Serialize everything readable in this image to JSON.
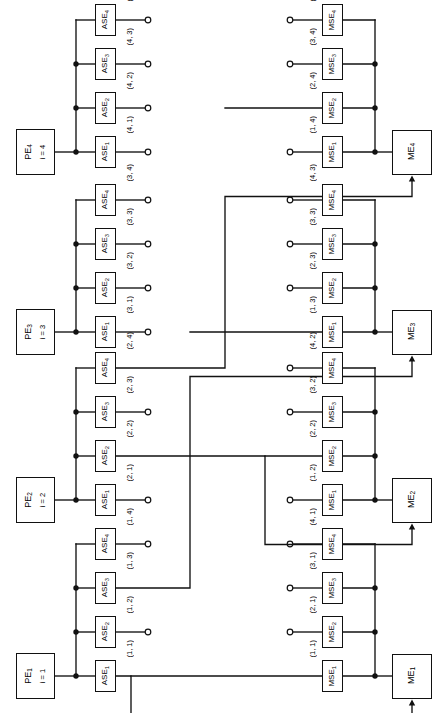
{
  "diagram": {
    "pe_label_prefix": "PE",
    "ase_label_prefix": "ASE",
    "mse_label_prefix": "MSE",
    "me_label_prefix": "ME",
    "line_color": "#111111",
    "background": "#ffffff"
  },
  "pe_groups": [
    {
      "id": "pe4",
      "name": "PE",
      "name_sub": "4",
      "index_text": "i = 4",
      "switches": [
        {
          "name": "ASE",
          "sub": "1",
          "port": "(4, 1)",
          "terminal": "open"
        },
        {
          "name": "ASE",
          "sub": "2",
          "port": "(4, 2)",
          "terminal": "open"
        },
        {
          "name": "ASE",
          "sub": "3",
          "port": "(4, 3)",
          "terminal": "open"
        },
        {
          "name": "ASE",
          "sub": "4",
          "port": "(4, 4)",
          "terminal": "open"
        }
      ]
    },
    {
      "id": "pe3",
      "name": "PE",
      "name_sub": "3",
      "index_text": "i = 3",
      "switches": [
        {
          "name": "ASE",
          "sub": "1",
          "port": "(3, 1)",
          "terminal": "open"
        },
        {
          "name": "ASE",
          "sub": "2",
          "port": "(3, 2)",
          "terminal": "open"
        },
        {
          "name": "ASE",
          "sub": "3",
          "port": "(3, 3)",
          "terminal": "open"
        },
        {
          "name": "ASE",
          "sub": "4",
          "port": "(3, 4)",
          "terminal": "open"
        }
      ]
    },
    {
      "id": "pe2",
      "name": "PE",
      "name_sub": "2",
      "index_text": "i = 2",
      "switches": [
        {
          "name": "ASE",
          "sub": "1",
          "port": "(2, 1)",
          "terminal": "open"
        },
        {
          "name": "ASE",
          "sub": "2",
          "port": "(2, 2)",
          "terminal": "routed"
        },
        {
          "name": "ASE",
          "sub": "3",
          "port": "(2, 3)",
          "terminal": "open"
        },
        {
          "name": "ASE",
          "sub": "4",
          "port": "(2, 4)",
          "terminal": "routed"
        }
      ]
    },
    {
      "id": "pe1",
      "name": "PE",
      "name_sub": "1",
      "index_text": "i = 1",
      "switches": [
        {
          "name": "ASE",
          "sub": "1",
          "port": "(1, 1)",
          "terminal": "routed"
        },
        {
          "name": "ASE",
          "sub": "2",
          "port": "(1, 2)",
          "terminal": "open"
        },
        {
          "name": "ASE",
          "sub": "3",
          "port": "(1, 3)",
          "terminal": "routed"
        },
        {
          "name": "ASE",
          "sub": "4",
          "port": "(1, 4)",
          "terminal": "open"
        }
      ]
    }
  ],
  "me_groups": [
    {
      "id": "me4",
      "name": "ME",
      "name_sub": "4",
      "switches": [
        {
          "name": "MSE",
          "sub": "1",
          "port": "(1, 4)",
          "terminal": "open"
        },
        {
          "name": "MSE",
          "sub": "2",
          "port": "(2, 4)",
          "terminal": "routed"
        },
        {
          "name": "MSE",
          "sub": "3",
          "port": "(3, 4)",
          "terminal": "open"
        },
        {
          "name": "MSE",
          "sub": "4",
          "port": "(4, 4)",
          "terminal": "open"
        }
      ]
    },
    {
      "id": "me3",
      "name": "ME",
      "name_sub": "3",
      "switches": [
        {
          "name": "MSE",
          "sub": "1",
          "port": "(1, 3)",
          "terminal": "routed"
        },
        {
          "name": "MSE",
          "sub": "2",
          "port": "(2, 3)",
          "terminal": "open"
        },
        {
          "name": "MSE",
          "sub": "3",
          "port": "(3, 3)",
          "terminal": "open"
        },
        {
          "name": "MSE",
          "sub": "4",
          "port": "(4, 3)",
          "terminal": "open"
        }
      ]
    },
    {
      "id": "me2",
      "name": "ME",
      "name_sub": "2",
      "switches": [
        {
          "name": "MSE",
          "sub": "1",
          "port": "(1, 2)",
          "terminal": "open"
        },
        {
          "name": "MSE",
          "sub": "2",
          "port": "(2, 2)",
          "terminal": "routed"
        },
        {
          "name": "MSE",
          "sub": "3",
          "port": "(3, 2)",
          "terminal": "open"
        },
        {
          "name": "MSE",
          "sub": "4",
          "port": "(4, 2)",
          "terminal": "open"
        }
      ]
    },
    {
      "id": "me1",
      "name": "ME",
      "name_sub": "1",
      "switches": [
        {
          "name": "MSE",
          "sub": "1",
          "port": "(1, 1)",
          "terminal": "routed"
        },
        {
          "name": "MSE",
          "sub": "2",
          "port": "(2, 1)",
          "terminal": "open"
        },
        {
          "name": "MSE",
          "sub": "3",
          "port": "(3, 1)",
          "terminal": "open"
        },
        {
          "name": "MSE",
          "sub": "4",
          "port": "(4, 1)",
          "terminal": "open"
        }
      ]
    }
  ],
  "routes": [
    {
      "id": "route-1-1",
      "from": "ASE (1, 1)",
      "to": "ME 1"
    },
    {
      "id": "route-1-3",
      "from": "ASE (1, 3)",
      "to": "ME 3"
    },
    {
      "id": "route-2-2",
      "from": "ASE (2, 2)",
      "to": "ME 2"
    },
    {
      "id": "route-2-4",
      "from": "ASE (2, 4)",
      "to": "ME 4"
    }
  ]
}
